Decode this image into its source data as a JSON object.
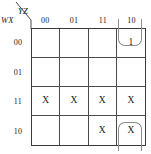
{
  "kmap": {
    "title": "Karnaugh map",
    "column_variables_label": "YZ",
    "row_variables_label": "WX",
    "column_headers": [
      "00",
      "01",
      "11",
      "10"
    ],
    "row_headers": [
      "00",
      "01",
      "11",
      "10"
    ],
    "cells": [
      [
        "",
        "",
        "",
        "1"
      ],
      [
        "",
        "",
        "",
        ""
      ],
      [
        "X",
        "X",
        "X",
        "X"
      ],
      [
        "",
        "",
        "X",
        "X"
      ]
    ],
    "groups": [
      {
        "name": "group-top-wrap",
        "cells": [
          "row00-col10"
        ],
        "value": "1",
        "open_edge": "top"
      },
      {
        "name": "group-bottom-wrap",
        "cells": [
          "row10-col10"
        ],
        "value": "X",
        "open_edge": "bottom"
      }
    ],
    "colors": {
      "grid_line": "#4a4a4a",
      "grid_border": "#3a3a3a",
      "loop": "#8c8c8c",
      "text": "#1a1a1a",
      "background": "#ffffff"
    }
  }
}
